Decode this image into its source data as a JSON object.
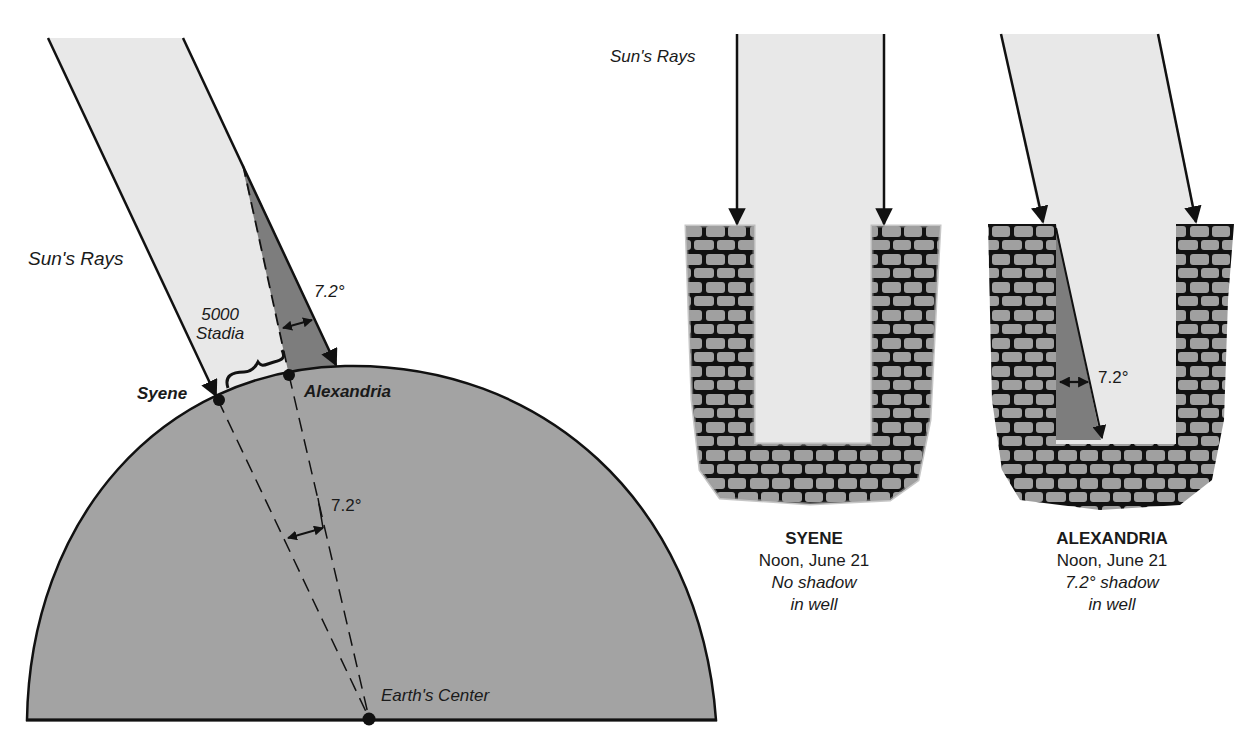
{
  "colors": {
    "earth": "#a3a3a3",
    "rays_fill": "#e8e8e8",
    "shadow": "#7d7d7d",
    "stone": "#a0a0a0",
    "outline": "#111111",
    "background": "#ffffff"
  },
  "left_diagram": {
    "sun_rays_label": "Sun's Rays",
    "distance_value": "5000",
    "distance_unit": "Stadia",
    "angle_top": "7.2°",
    "angle_center": "7.2°",
    "city_1": "Syene",
    "city_2": "Alexandria",
    "center_label": "Earth's Center"
  },
  "wells": [
    {
      "sun_rays_label": "Sun's Rays",
      "title": "SYENE",
      "time": "Noon, June 21",
      "note_line1": "No shadow",
      "note_line2": "in well"
    },
    {
      "angle": "7.2°",
      "title": "ALEXANDRIA",
      "time": "Noon, June 21",
      "note_line1": "7.2° shadow",
      "note_line2": "in well"
    }
  ]
}
